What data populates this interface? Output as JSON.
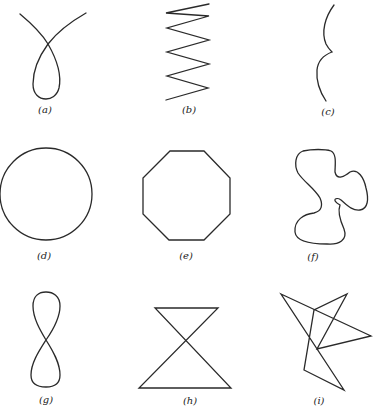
{
  "figure": {
    "panels": [
      {
        "id": "a",
        "label": "(a)",
        "description": "open curve with a single loop (self-crossing)"
      },
      {
        "id": "b",
        "label": "(b)",
        "description": "zigzag polyline"
      },
      {
        "id": "c",
        "label": "(c)",
        "description": "open curve with a cusp"
      },
      {
        "id": "d",
        "label": "(d)",
        "description": "circle"
      },
      {
        "id": "e",
        "label": "(e)",
        "description": "regular octagon"
      },
      {
        "id": "f",
        "label": "(f)",
        "description": "closed smooth irregular curve"
      },
      {
        "id": "g",
        "label": "(g)",
        "description": "figure eight"
      },
      {
        "id": "h",
        "label": "(h)",
        "description": "bow-tie (hourglass) closed polygon"
      },
      {
        "id": "i",
        "label": "(i)",
        "description": "self-intersecting closed polygon"
      }
    ],
    "stroke_color": "#2a2a2a",
    "background": "#ffffff"
  }
}
